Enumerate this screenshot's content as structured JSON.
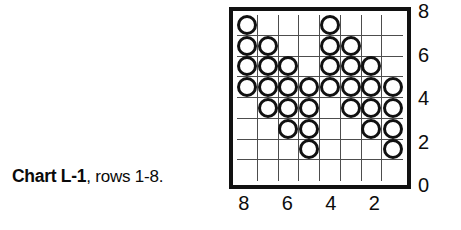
{
  "caption": {
    "bold_text": "Chart L-1",
    "rest_text": ", rows 1-8."
  },
  "chart_data": {
    "type": "heatmap",
    "title": "Chart L-1, rows 1-8.",
    "xlabel": "",
    "ylabel": "",
    "grid": true,
    "legend_position": "none",
    "columns": 8,
    "rows": 8,
    "x_tick_labels": [
      "8",
      "6",
      "4",
      "2"
    ],
    "x_tick_columns": [
      1,
      3,
      5,
      7
    ],
    "x_axis_direction": "right-to-left",
    "y_tick_labels": [
      "8",
      "6",
      "4",
      "2",
      "0"
    ],
    "y_tick_rows": [
      8,
      6,
      4,
      2,
      0
    ],
    "y_axis_direction": "bottom-to-top",
    "symbol": "circle",
    "cell_values": {
      "row_8": [
        1,
        0,
        0,
        0,
        1,
        0,
        0,
        0
      ],
      "row_7": [
        1,
        1,
        0,
        0,
        1,
        1,
        0,
        0
      ],
      "row_6": [
        1,
        1,
        1,
        0,
        1,
        1,
        1,
        0
      ],
      "row_5": [
        1,
        1,
        1,
        1,
        1,
        1,
        1,
        1
      ],
      "row_4": [
        0,
        1,
        1,
        1,
        0,
        1,
        1,
        1
      ],
      "row_3": [
        0,
        0,
        1,
        1,
        0,
        0,
        1,
        1
      ],
      "row_2": [
        0,
        0,
        0,
        1,
        0,
        0,
        0,
        1
      ],
      "row_1": [
        0,
        0,
        0,
        0,
        0,
        0,
        0,
        0
      ]
    },
    "stitch_counts_per_row": {
      "row_8": 2,
      "row_7": 4,
      "row_6": 6,
      "row_5": 8,
      "row_4": 6,
      "row_3": 4,
      "row_2": 2,
      "row_1": 0
    },
    "total_symbols": 32,
    "colors": {
      "background": "#ffffff",
      "frame": "#111111",
      "gridline": "#4d4d4d",
      "symbol_outline": "#111111",
      "text": "#0c0c0c"
    }
  }
}
